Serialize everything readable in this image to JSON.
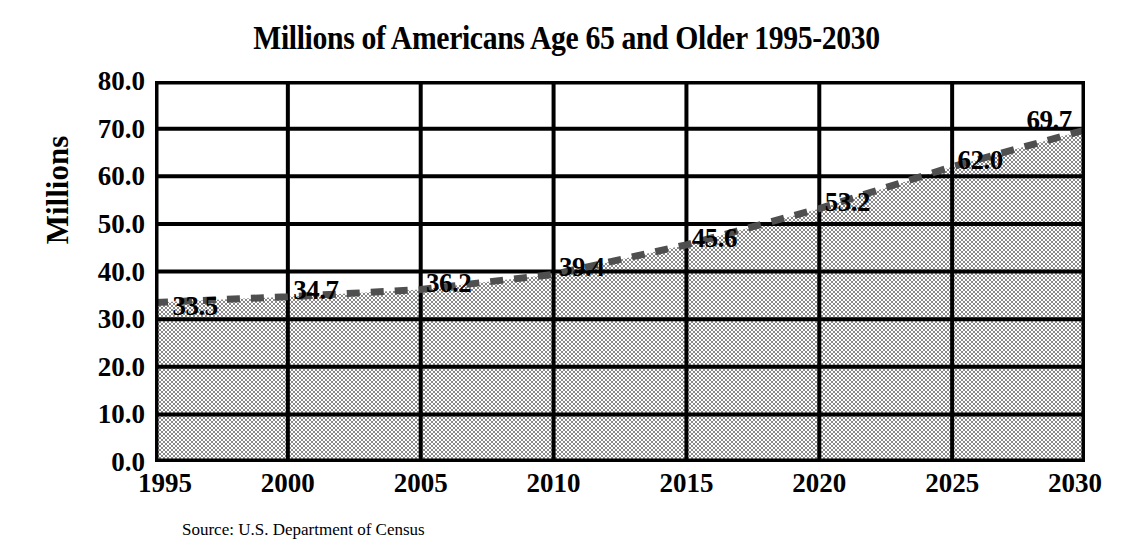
{
  "chart_data": {
    "type": "area",
    "title": "Millions of Americans Age 65 and Older 1995-2030",
    "xlabel": "",
    "ylabel": "Millions",
    "categories": [
      "1995",
      "2000",
      "2005",
      "2010",
      "2015",
      "2020",
      "2025",
      "2030"
    ],
    "values": [
      33.5,
      34.7,
      36.2,
      39.4,
      45.6,
      53.2,
      62.0,
      69.7
    ],
    "point_labels": [
      "33.5",
      "34.7",
      "36.2",
      "39.4",
      "45.6",
      "53.2",
      "62.0",
      "69.7"
    ],
    "ylim": [
      0,
      80
    ],
    "ytick_labels": [
      "80.0",
      "70.0",
      "60.0",
      "50.0",
      "40.0",
      "30.0",
      "20.0",
      "10.0",
      "0.0"
    ],
    "ytick_values": [
      80,
      70,
      60,
      50,
      40,
      30,
      20,
      10,
      0
    ],
    "grid": true,
    "legend": "none",
    "series_name": "Millions of Americans Age 65 and Older",
    "line_style": "dashed",
    "fill_style": "gray-halftone",
    "colors": {
      "fill": "#a9a9a9",
      "line": "#4f4f4f",
      "grid": "#000000",
      "axis": "#000000",
      "text": "#000000",
      "background": "#ffffff"
    }
  },
  "source": {
    "note": "Source: U.S. Department of Census"
  }
}
